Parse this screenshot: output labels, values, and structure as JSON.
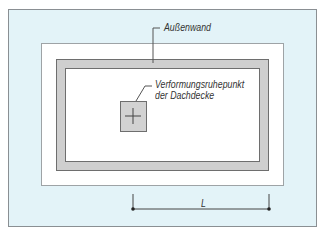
{
  "diagram": {
    "labels": {
      "outer_wall": "Außenwand",
      "rest_point_line1": "Verformungsruhepunkt",
      "rest_point_line2": "der Dachdecke",
      "dimension": "L"
    },
    "colors": {
      "background_frame": "#e3f3f8",
      "wall_fill": "#cfcfcf",
      "outline": "#6e6e6e",
      "interior": "#ffffff"
    }
  }
}
